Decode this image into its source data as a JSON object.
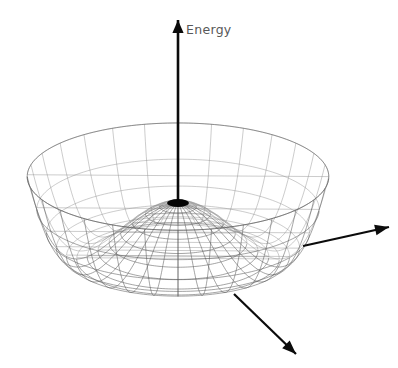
{
  "figure": {
    "title": "",
    "background_color": "#ffffff",
    "axes": {
      "vertical": {
        "label": "Energy",
        "icon": "up-arrow-icon",
        "color": "#0b0b0b",
        "tail": [
          178,
          205
        ],
        "tip": [
          178,
          20
        ]
      },
      "right": {
        "label": "",
        "icon": "right-arrow-icon",
        "color": "#0b0b0b",
        "tail": [
          303,
          246
        ],
        "tip": [
          389,
          227
        ]
      },
      "front": {
        "label": "",
        "icon": "down-right-arrow-icon",
        "color": "#0b0b0b",
        "tail": [
          234,
          294
        ],
        "tip": [
          296,
          354
        ]
      }
    },
    "marker": {
      "name": "peak-dot",
      "color": "#050505",
      "center": [
        178,
        203
      ],
      "rx": 11,
      "ry": 4
    }
  },
  "chart_data": {
    "type": "surface",
    "title": "",
    "subtitle": "",
    "xlabel": "",
    "ylabel": "",
    "zlabel": "Energy",
    "grid": true,
    "legend": false,
    "legend_position": "none",
    "surface_name": "mexican-hat-potential",
    "function": "V(r) = a*r^4 - b*r^2",
    "coefficients": {
      "a": 1.0,
      "b": 1.9
    },
    "r_range": [
      0,
      1.45
    ],
    "theta_range_deg": [
      0,
      360
    ],
    "n_radial_lines": 28,
    "n_circumferential_lines": 13,
    "annotations": [
      {
        "text": "Energy",
        "at": [
          186,
          30
        ],
        "color": "#585858"
      }
    ],
    "projection": {
      "name": "oblique-axonometric",
      "center": [
        178,
        203
      ],
      "x_scale": 104,
      "y_scale": 37,
      "z_scale": 62
    },
    "features": {
      "central_maximum": {
        "r": 0,
        "V": 0.0
      },
      "minimum_ring": {
        "r": 0.975,
        "V": -0.903
      },
      "outer_rim": {
        "r": 1.45,
        "V": 0.425
      }
    }
  }
}
